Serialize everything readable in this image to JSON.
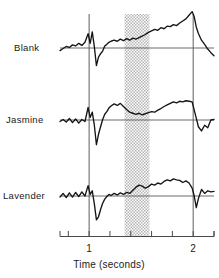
{
  "chart_data": {
    "type": "line",
    "title": "",
    "subtitle": "",
    "xlabel": "Time (seconds)",
    "ylabel": "",
    "xlim": [
      0.72,
      2.2
    ],
    "xticks": [
      0.8,
      1.0,
      1.2,
      1.4,
      1.6,
      1.8,
      2.0,
      2.2
    ],
    "xtick_labels": [
      "",
      "1",
      "",
      "",
      "",
      "",
      "2",
      ""
    ],
    "grid": false,
    "legend": "none",
    "annotations": {
      "event_lines": [
        {
          "name": "onset-line-1s",
          "x": 1.0
        },
        {
          "name": "offset-line-2s",
          "x": 2.0
        }
      ],
      "shaded_band": {
        "name": "stimulus-window",
        "x_start": 1.34,
        "x_end": 1.58,
        "pattern": "stipple"
      }
    },
    "series": [
      {
        "name": "Blank",
        "baseline_y": 0,
        "x": [
          0.72,
          0.75,
          0.78,
          0.81,
          0.84,
          0.87,
          0.9,
          0.93,
          0.96,
          0.99,
          1.01,
          1.03,
          1.05,
          1.07,
          1.09,
          1.11,
          1.13,
          1.15,
          1.17,
          1.19,
          1.21,
          1.24,
          1.27,
          1.3,
          1.33,
          1.36,
          1.39,
          1.42,
          1.45,
          1.48,
          1.51,
          1.54,
          1.57,
          1.6,
          1.63,
          1.66,
          1.69,
          1.72,
          1.75,
          1.78,
          1.81,
          1.84,
          1.87,
          1.9,
          1.93,
          1.96,
          1.99,
          2.01,
          2.03,
          2.05,
          2.08,
          2.11,
          2.14,
          2.17,
          2.2
        ],
        "y": [
          -0.1,
          -0.02,
          0.06,
          0.02,
          0.12,
          0.08,
          0.18,
          0.1,
          0.22,
          0.55,
          0.18,
          0.62,
          0.05,
          -0.68,
          -0.35,
          -0.22,
          -0.12,
          0.08,
          0.14,
          0.22,
          0.26,
          0.3,
          0.26,
          0.34,
          0.28,
          0.36,
          0.3,
          0.38,
          0.34,
          0.4,
          0.46,
          0.52,
          0.6,
          0.66,
          0.72,
          0.68,
          0.78,
          0.74,
          0.84,
          0.82,
          0.9,
          0.86,
          0.96,
          1.04,
          1.12,
          1.26,
          1.4,
          1.2,
          0.8,
          0.56,
          0.3,
          0.14,
          -0.04,
          -0.18,
          -0.3
        ]
      },
      {
        "name": "Jasmine",
        "baseline_y": 0,
        "x": [
          0.72,
          0.75,
          0.78,
          0.81,
          0.84,
          0.87,
          0.9,
          0.93,
          0.96,
          0.99,
          1.01,
          1.03,
          1.05,
          1.07,
          1.09,
          1.11,
          1.13,
          1.15,
          1.17,
          1.19,
          1.21,
          1.24,
          1.27,
          1.3,
          1.33,
          1.36,
          1.39,
          1.42,
          1.45,
          1.48,
          1.51,
          1.54,
          1.57,
          1.6,
          1.63,
          1.66,
          1.69,
          1.72,
          1.75,
          1.78,
          1.81,
          1.84,
          1.87,
          1.9,
          1.93,
          1.96,
          1.99,
          2.01,
          2.03,
          2.05,
          2.08,
          2.11,
          2.14,
          2.17,
          2.2
        ],
        "y": [
          -0.06,
          0.02,
          -0.08,
          0.06,
          -0.1,
          0.04,
          -0.12,
          0.02,
          -0.06,
          0.48,
          0.1,
          0.3,
          -0.2,
          -0.95,
          -0.55,
          -0.26,
          0.02,
          0.22,
          0.32,
          0.46,
          0.54,
          0.62,
          0.56,
          0.64,
          0.52,
          0.4,
          0.3,
          0.26,
          0.22,
          0.26,
          0.2,
          0.24,
          0.28,
          0.32,
          0.3,
          0.38,
          0.44,
          0.52,
          0.58,
          0.64,
          0.7,
          0.66,
          0.72,
          0.7,
          0.74,
          0.72,
          0.7,
          0.38,
          0.06,
          -0.26,
          -0.42,
          -0.2,
          -0.3,
          0.0,
          0.02
        ]
      },
      {
        "name": "Lavender",
        "baseline_y": 0,
        "x": [
          0.72,
          0.75,
          0.78,
          0.81,
          0.84,
          0.87,
          0.9,
          0.93,
          0.96,
          0.99,
          1.01,
          1.03,
          1.05,
          1.07,
          1.09,
          1.11,
          1.13,
          1.15,
          1.17,
          1.19,
          1.21,
          1.24,
          1.27,
          1.3,
          1.33,
          1.36,
          1.39,
          1.42,
          1.45,
          1.48,
          1.51,
          1.54,
          1.57,
          1.6,
          1.63,
          1.66,
          1.69,
          1.72,
          1.75,
          1.78,
          1.81,
          1.84,
          1.87,
          1.9,
          1.93,
          1.96,
          1.99,
          2.01,
          2.03,
          2.05,
          2.08,
          2.11,
          2.14,
          2.17,
          2.2
        ],
        "y": [
          -0.04,
          0.1,
          -0.06,
          0.12,
          -0.04,
          0.14,
          -0.02,
          0.16,
          0.0,
          0.4,
          0.06,
          0.2,
          -0.3,
          -0.92,
          -0.8,
          -0.52,
          -0.28,
          -0.12,
          -0.02,
          0.06,
          0.02,
          0.1,
          0.04,
          0.12,
          0.06,
          0.14,
          0.1,
          0.22,
          0.34,
          0.42,
          0.38,
          0.3,
          0.36,
          0.46,
          0.42,
          0.5,
          0.46,
          0.56,
          0.62,
          0.58,
          0.66,
          0.62,
          0.6,
          0.52,
          0.58,
          0.5,
          0.3,
          0.0,
          -0.45,
          -0.1,
          0.25,
          0.1,
          0.2,
          0.16,
          0.18
        ]
      }
    ]
  },
  "figure": {
    "trace_labels": [
      "Blank",
      "Jasmine",
      "Lavender"
    ],
    "axis_title": "Time (seconds)",
    "tick_label_one": "1",
    "tick_label_two": "2",
    "colors": {
      "trace": "#1a1a1a",
      "baseline": "#555555",
      "event_line": "#666666",
      "stipple": "#b9b9b9",
      "axis": "#4a4a4a",
      "background": "#ffffff"
    }
  }
}
